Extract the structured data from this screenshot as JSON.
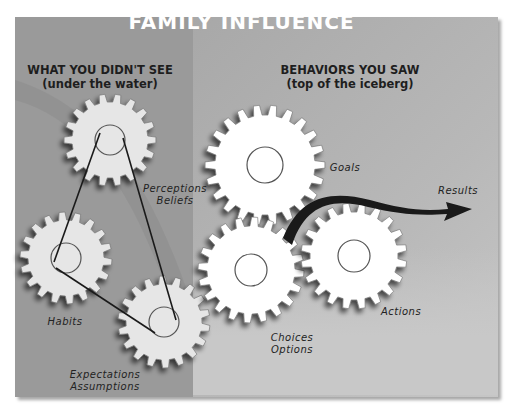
{
  "diagram": {
    "title": "FAMILY INFLUENCE",
    "left_section": {
      "heading": "WHAT YOU DIDN'T SEE",
      "subheading": "(under the water)"
    },
    "right_section": {
      "heading": "BEHAVIORS YOU SAW",
      "subheading": "(top of the iceberg)"
    },
    "gears": [
      {
        "id": "perceptions",
        "label_line1": "Perceptions",
        "label_line2": "Beliefs",
        "color": "#e6e6e6"
      },
      {
        "id": "habits",
        "label_line1": "Habits",
        "label_line2": "",
        "color": "#e6e6e6"
      },
      {
        "id": "expectations",
        "label_line1": "Expectations",
        "label_line2": "Assumptions",
        "color": "#e6e6e6"
      },
      {
        "id": "goals",
        "label_line1": "Goals",
        "label_line2": "",
        "color": "#ffffff"
      },
      {
        "id": "choices",
        "label_line1": "Choices",
        "label_line2": "Options",
        "color": "#ffffff"
      },
      {
        "id": "actions",
        "label_line1": "Actions",
        "label_line2": "",
        "color": "#ffffff"
      }
    ],
    "arrow_label": "Results",
    "colors": {
      "panel": "#a3a3a3",
      "left_zone": "#9a9a9a",
      "title_text": "#ffffff",
      "belt": "#1a1a1a",
      "arrow": "#1a1a1a"
    }
  }
}
